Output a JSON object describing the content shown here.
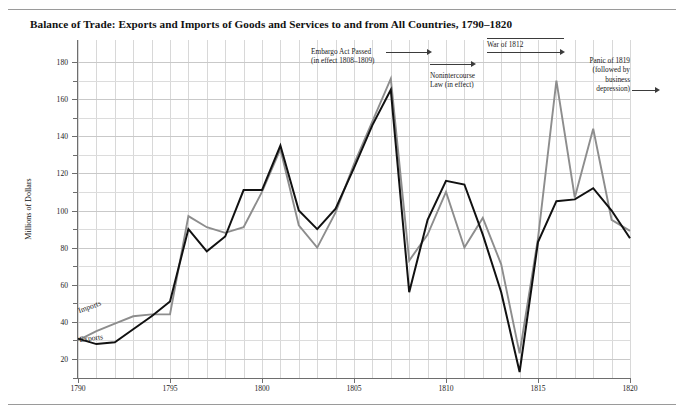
{
  "chart_data": {
    "type": "line",
    "title": "Balance of Trade: Exports and Imports of Goods and Services  to and from All Countries, 1790–1820",
    "xlabel": "",
    "ylabel": "Millions of Dollars",
    "xlim": [
      1790,
      1820
    ],
    "ylim": [
      0,
      188
    ],
    "ylim_labeled": [
      20,
      180
    ],
    "ytick_step": 20,
    "yminor_step": 10,
    "xtick_step": 5,
    "xminor_step": 1,
    "grid": true,
    "legend": "inline-labels",
    "x": [
      1790,
      1791,
      1792,
      1793,
      1794,
      1795,
      1796,
      1797,
      1798,
      1799,
      1800,
      1801,
      1802,
      1803,
      1804,
      1805,
      1806,
      1807,
      1808,
      1809,
      1810,
      1811,
      1812,
      1813,
      1814,
      1815,
      1816,
      1817,
      1818,
      1819,
      1820
    ],
    "series": [
      {
        "name": "Exports",
        "color": "#111111",
        "values": [
          31,
          28,
          29,
          36,
          43,
          51,
          90,
          78,
          86,
          111,
          111,
          135,
          100,
          90,
          101,
          123,
          146,
          165,
          56,
          95,
          116,
          114,
          87,
          56,
          13,
          83,
          105,
          106,
          112,
          100,
          85
        ]
      },
      {
        "name": "Imports",
        "color": "#8d8d8d",
        "values": [
          30,
          35,
          39,
          43,
          44,
          44,
          97,
          91,
          88,
          91,
          110,
          133,
          92,
          80,
          99,
          125,
          148,
          171,
          73,
          87,
          110,
          80,
          96,
          71,
          23,
          85,
          170,
          107,
          144,
          95,
          89
        ]
      }
    ],
    "ytick_labels": [
      "180",
      "160",
      "140",
      "120",
      "100",
      "80",
      "60",
      "40",
      "20"
    ],
    "xtick_labels": [
      "1790",
      "1795",
      "1800",
      "1805",
      "1810",
      "1815",
      "1820"
    ],
    "annotations": [
      {
        "id": "embargo",
        "text": "Embargo Act Passed",
        "text2": "(in effect 1808–1809)",
        "arrow": "right"
      },
      {
        "id": "nonintercourse",
        "text": "Nonintercourse",
        "text2": "Law (in effect)",
        "arrow": "right"
      },
      {
        "id": "war",
        "text": "War of 1812",
        "arrow": "right"
      },
      {
        "id": "panic",
        "text": "Panic of 1819",
        "text2": "(followed by",
        "text3": "business",
        "text4": "depression)",
        "arrow": "right"
      }
    ],
    "series_labels": {
      "imports": "Imports",
      "exports": "Exports"
    }
  }
}
